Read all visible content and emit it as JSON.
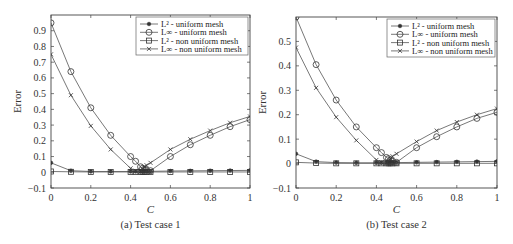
{
  "chart_data": [
    {
      "type": "line",
      "title": "",
      "caption": "(a)  Test case 1",
      "xlabel": "C",
      "ylabel": "Error",
      "xlim": [
        0,
        1
      ],
      "ylim": [
        -0.1,
        1.0
      ],
      "xticks": [
        0,
        0.2,
        0.4,
        0.6,
        0.8,
        1
      ],
      "xtick_labels": [
        "0",
        "0.2",
        "0.4",
        "0.6",
        "0.8",
        "1"
      ],
      "yticks": [
        -0.1,
        0,
        0.1,
        0.2,
        0.3,
        0.4,
        0.5,
        0.6,
        0.7,
        0.8,
        0.9
      ],
      "ytick_labels": [
        "−0.1",
        "0",
        "0.1",
        "0.2",
        "0.3",
        "0.4",
        "0.5",
        "0.6",
        "0.7",
        "0.8",
        "0.9"
      ],
      "grid": false,
      "legend_position": "upper right",
      "x": [
        0,
        0.1,
        0.2,
        0.3,
        0.4,
        0.425,
        0.45,
        0.46,
        0.47,
        0.48,
        0.5,
        0.6,
        0.7,
        0.8,
        0.9,
        1.0
      ],
      "series": [
        {
          "name": "L² - uniform mesh",
          "marker": "dot",
          "values": [
            0.06,
            0.01,
            0.005,
            0.005,
            0.005,
            0.005,
            0.005,
            0.005,
            0.005,
            0.005,
            0.006,
            0.008,
            0.009,
            0.01,
            0.011,
            0.012
          ]
        },
        {
          "name": "L∞ - uniform mesh",
          "marker": "circle",
          "values": [
            0.95,
            0.64,
            0.41,
            0.235,
            0.1,
            0.07,
            0.035,
            0.025,
            0.02,
            0.015,
            0.01,
            0.1,
            0.175,
            0.235,
            0.29,
            0.335
          ]
        },
        {
          "name": "L² - non uniform mesh",
          "marker": "square",
          "values": [
            0.005,
            0.003,
            0.002,
            0.002,
            0.002,
            0.002,
            0.002,
            0.002,
            0.002,
            0.002,
            0.002,
            0.002,
            0.002,
            0.002,
            0.002,
            0.002
          ]
        },
        {
          "name": "L∞ - non uniform mesh",
          "marker": "x",
          "values": [
            0.75,
            0.49,
            0.295,
            0.145,
            0.025,
            0.01,
            0.005,
            0.02,
            0.035,
            0.045,
            0.06,
            0.145,
            0.21,
            0.265,
            0.315,
            0.355
          ]
        }
      ]
    },
    {
      "type": "line",
      "title": "",
      "caption": "(b)  Test case 2",
      "xlabel": "C",
      "ylabel": "Error",
      "xlim": [
        0,
        1
      ],
      "ylim": [
        -0.1,
        0.6
      ],
      "xticks": [
        0,
        0.2,
        0.4,
        0.6,
        0.8,
        1
      ],
      "xtick_labels": [
        "0",
        "0.2",
        "0.4",
        "0.6",
        "0.8",
        "1"
      ],
      "yticks": [
        -0.1,
        0,
        0.1,
        0.2,
        0.3,
        0.4,
        0.5
      ],
      "ytick_labels": [
        "−0.1",
        "0",
        "0.1",
        "0.2",
        "0.3",
        "0.4",
        "0.5"
      ],
      "grid": false,
      "legend_position": "upper right",
      "x": [
        0,
        0.1,
        0.2,
        0.3,
        0.4,
        0.425,
        0.45,
        0.46,
        0.47,
        0.48,
        0.5,
        0.6,
        0.7,
        0.8,
        0.9,
        1.0
      ],
      "series": [
        {
          "name": "L² - uniform mesh",
          "marker": "dot",
          "values": [
            0.04,
            0.008,
            0.004,
            0.003,
            0.003,
            0.003,
            0.003,
            0.003,
            0.003,
            0.003,
            0.004,
            0.005,
            0.006,
            0.007,
            0.008,
            0.009
          ]
        },
        {
          "name": "L∞ - uniform mesh",
          "marker": "circle",
          "values": [
            0.6,
            0.405,
            0.26,
            0.15,
            0.065,
            0.045,
            0.025,
            0.02,
            0.015,
            0.01,
            0.005,
            0.065,
            0.11,
            0.15,
            0.185,
            0.21
          ]
        },
        {
          "name": "L² - non uniform mesh",
          "marker": "square",
          "values": [
            0.005,
            0.002,
            0.001,
            0.001,
            0.001,
            0.001,
            0.001,
            0.001,
            0.001,
            0.001,
            0.001,
            0.001,
            0.001,
            0.001,
            0.001,
            0.001
          ]
        },
        {
          "name": "L∞ - non uniform mesh",
          "marker": "x",
          "values": [
            0.475,
            0.31,
            0.19,
            0.095,
            0.015,
            0.005,
            0.003,
            0.01,
            0.02,
            0.03,
            0.04,
            0.09,
            0.135,
            0.17,
            0.2,
            0.225
          ]
        }
      ]
    }
  ],
  "layout": {
    "panels": [
      {
        "left": 51,
        "right": 250,
        "top": 15,
        "bottom": 188,
        "caption_y": 228,
        "xlabel_y": 213
      },
      {
        "left": 296,
        "right": 497,
        "top": 17,
        "bottom": 188,
        "caption_y": 228,
        "xlabel_y": 213
      }
    ],
    "colors": {
      "axis": "#444444",
      "line": "#555555",
      "marker": "#333333",
      "legend_border": "#666666"
    }
  }
}
